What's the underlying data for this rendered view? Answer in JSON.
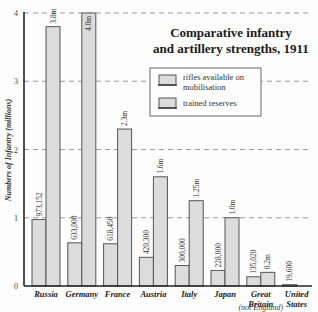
{
  "chart_data": {
    "type": "bar",
    "title": "Comparative infantry and artillery strengths, 1911",
    "title_lines": [
      "Comparative infantry",
      "and artillery strengths, 1911"
    ],
    "xlabel": "",
    "ylabel": "Numbers of Infantry (millions)",
    "ylim": [
      0,
      4
    ],
    "yticks": [
      0,
      1,
      2,
      3,
      4
    ],
    "grid": true,
    "legend_position": "upper right",
    "categories": [
      "Russia",
      "Germany",
      "France",
      "Austria",
      "Italy",
      "Japan",
      "Great Britain",
      "United States"
    ],
    "category_notes": {
      "Great Britain": "(not England)"
    },
    "series": [
      {
        "name": "rifles available on mobilisation",
        "values": [
          0.973152,
          0.633,
          0.61845,
          0.4203,
          0.3,
          0.228,
          0.13502,
          0.0196
        ],
        "labels": [
          "973,152",
          "633,000",
          "618,450",
          "420,300",
          "300,000",
          "228,000",
          "135,020",
          "19,600"
        ]
      },
      {
        "name": "trained reserves",
        "values": [
          3.8,
          4.0,
          2.3,
          1.6,
          1.25,
          1.0,
          0.2,
          null
        ],
        "labels": [
          "3.8m",
          "4.0m",
          "2.3m",
          "1.6m",
          "1.25m",
          "1.0m",
          "0.2m",
          ""
        ]
      }
    ]
  },
  "legend": {
    "items": [
      "rifles available on mobilisation",
      "trained reserves"
    ],
    "line1": [
      "rifles available on",
      "mobilisation"
    ],
    "line2": "trained reserves"
  }
}
